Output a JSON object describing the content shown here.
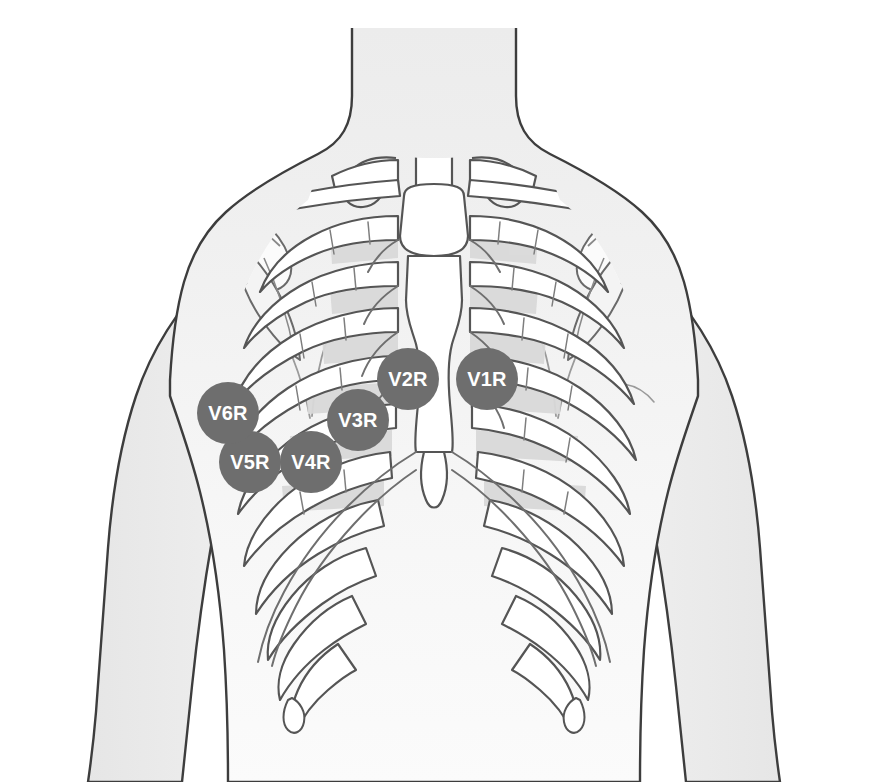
{
  "diagram": {
    "view": "anterior",
    "background_color": "#ffffff"
  },
  "palette": {
    "electrode_fill": "#6e6e6e",
    "electrode_text": "#ffffff",
    "skin_fill": "#e3e3e3",
    "skin_fill_light": "#efefef",
    "torso_fill": "#f2f2f2",
    "bone_fill": "#ffffff",
    "bone_outline": "#555555",
    "body_outline": "#3d3d3d",
    "intercostal_shade": "#d7d7d7",
    "cartilage_shade": "#e8e8e8"
  },
  "electrodes": [
    {
      "id": "v1r",
      "label": "V1R",
      "cx": 487,
      "cy": 379,
      "r": 31,
      "name": "electrode-v1r"
    },
    {
      "id": "v2r",
      "label": "V2R",
      "cx": 408,
      "cy": 379,
      "r": 31,
      "name": "electrode-v2r"
    },
    {
      "id": "v3r",
      "label": "V3R",
      "cx": 358,
      "cy": 420,
      "r": 31,
      "name": "electrode-v3r"
    },
    {
      "id": "v4r",
      "label": "V4R",
      "cx": 311,
      "cy": 462,
      "r": 31,
      "name": "electrode-v4r"
    },
    {
      "id": "v5r",
      "label": "V5R",
      "cx": 250,
      "cy": 462,
      "r": 31,
      "name": "electrode-v5r"
    },
    {
      "id": "v6r",
      "label": "V6R",
      "cx": 228,
      "cy": 413,
      "r": 31,
      "name": "electrode-v6r"
    }
  ],
  "anatomy": {
    "structures": [
      "neck",
      "shoulders",
      "deltoid-left",
      "deltoid-right",
      "arm-left",
      "arm-right",
      "torso",
      "clavicle-left",
      "clavicle-right",
      "scapula-left",
      "scapula-right",
      "manubrium",
      "sternum-body",
      "xiphoid-process",
      "ribs",
      "costal-cartilage",
      "costal-margin"
    ],
    "rib_pair_count": 10
  }
}
